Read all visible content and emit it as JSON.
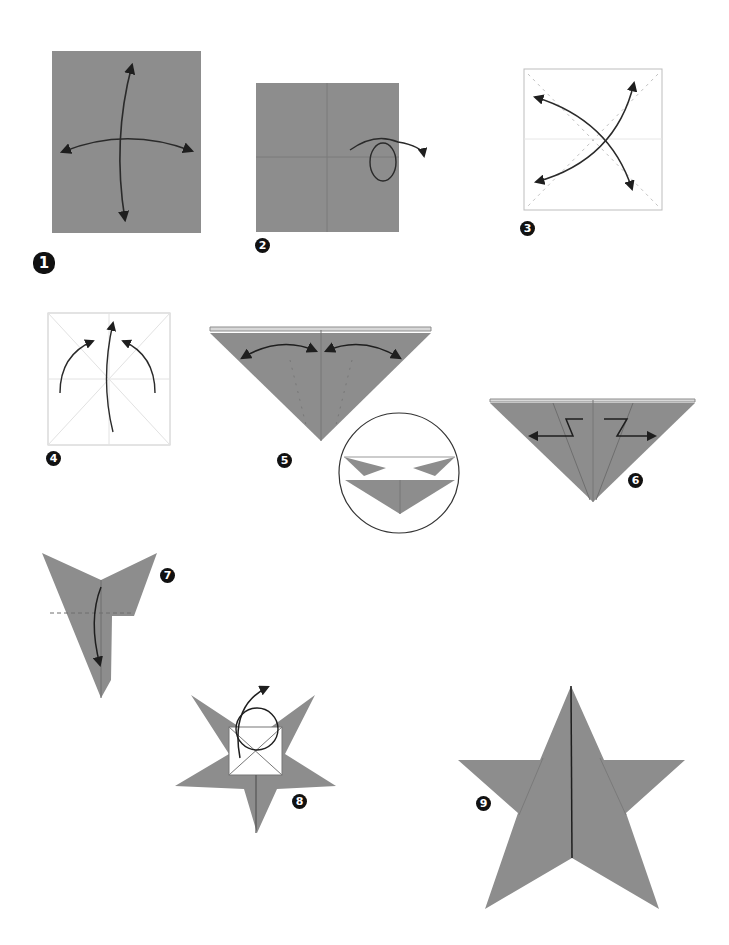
{
  "diagram": {
    "paper_color": "#8d8d8d",
    "line_color": "#2a2a2a",
    "crease_color": "#bdbdbd",
    "steps": [
      {
        "number": "1",
        "description": "Rectangle paper with fold-and-unfold arrows both directions"
      },
      {
        "number": "2",
        "description": "Square with center creases; turn over"
      },
      {
        "number": "3",
        "description": "Fold and unfold diagonals"
      },
      {
        "number": "4",
        "description": "Collapse along creases (arrows upward)"
      },
      {
        "number": "5",
        "description": "Fold flaps to center line and unfold; detail circle"
      },
      {
        "number": "6",
        "description": "Inside reverse folds outward"
      },
      {
        "number": "7",
        "description": "Fold down along center"
      },
      {
        "number": "8",
        "description": "Tuck top flap; turn over"
      },
      {
        "number": "9",
        "description": "Completed five-pointed star"
      }
    ]
  }
}
